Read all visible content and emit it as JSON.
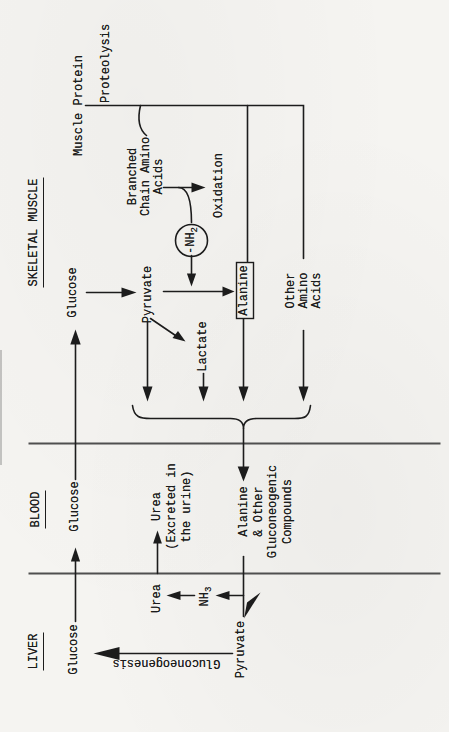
{
  "figure": {
    "colors": {
      "paper": "#f5f4f1",
      "ink": "#1c1c1c",
      "divider": "#4f4f4f"
    }
  },
  "sections": {
    "liver": {
      "header": "LIVER",
      "glucose": "Glucose",
      "gluconeogenesis": "Gluconeogenesis",
      "pyruvate": "Pyruvate",
      "urea": "Urea",
      "nh3": {
        "base": "NH",
        "sub": "3"
      }
    },
    "blood": {
      "header": "BLOOD",
      "glucose": "Glucose",
      "urea_note": "Urea\n(Excreted in\nthe urine)",
      "alanine_note": "Alanine\n& Other\nGluconeogenic\nCompounds"
    },
    "muscle": {
      "header": "SKELETAL MUSCLE",
      "glucose": "Glucose",
      "pyruvate": "Pyruvate",
      "lactate": "Lactate",
      "alanine": "Alanine",
      "nh2": {
        "base": "-NH",
        "sub": "2"
      },
      "branched_chain": "Branched\nChain Amino\nAcids",
      "oxidation": "Oxidation",
      "other_amino_acids": "Other\nAmino\nAcids",
      "muscle_protein": "Muscle Protein",
      "proteolysis": "Proteolysis"
    }
  }
}
